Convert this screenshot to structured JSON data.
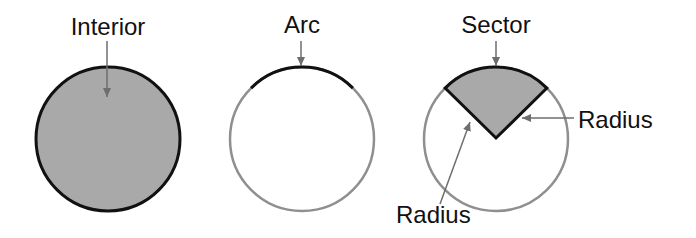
{
  "diagram": {
    "colors": {
      "fill": "#a9a9a9",
      "outline_dark": "#111111",
      "outline_light": "#8f8f8f",
      "arrow": "#6e6e6e",
      "text": "#111111",
      "background": "#ffffff"
    },
    "figures": [
      {
        "id": "interior",
        "label": "Interior",
        "description": "Filled circle with a dark outline; the arrow points into the shaded interior."
      },
      {
        "id": "arc",
        "label": "Arc",
        "description": "Unfilled circle with light outline; the top portion (arc) is drawn darker."
      },
      {
        "id": "sector",
        "label": "Sector",
        "description": "Unfilled circle with a shaded wedge (sector) bounded by two radii and an arc.",
        "radius_labels": [
          "Radius",
          "Radius"
        ]
      }
    ]
  }
}
